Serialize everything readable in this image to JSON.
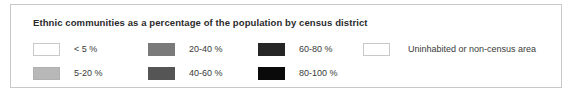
{
  "legend": {
    "title": "Ethnic communities as a percentage of the population by census district",
    "border_color": "#c9c9c9",
    "background_color": "#ffffff",
    "title_color": "#2b2b2b",
    "label_color": "#3a3a3a",
    "items": [
      {
        "label": "< 5 %",
        "color": "#ffffff",
        "border_color": "#c9c9c9",
        "swatch_name": "swatch-lt-5-percent",
        "column": 0,
        "row": 0
      },
      {
        "label": "5-20 %",
        "color": "#b8b8b8",
        "border_color": "#b0b0b0",
        "swatch_name": "swatch-5-20-percent",
        "column": 0,
        "row": 1
      },
      {
        "label": "20-40 %",
        "color": "#7a7a7a",
        "border_color": "#7a7a7a",
        "swatch_name": "swatch-20-40-percent",
        "column": 1,
        "row": 0
      },
      {
        "label": "40-60 %",
        "color": "#555555",
        "border_color": "#555555",
        "swatch_name": "swatch-40-60-percent",
        "column": 1,
        "row": 1
      },
      {
        "label": "60-80 %",
        "color": "#262626",
        "border_color": "#262626",
        "swatch_name": "swatch-60-80-percent",
        "column": 2,
        "row": 0
      },
      {
        "label": "80-100 %",
        "color": "#0a0a0a",
        "border_color": "#0a0a0a",
        "swatch_name": "swatch-80-100-percent",
        "column": 2,
        "row": 1
      },
      {
        "label": "Uninhabited or non-census area",
        "color": "#ffffff",
        "border_color": "#c9c9c9",
        "swatch_name": "swatch-uninhabited",
        "column": 3,
        "row": 0
      }
    ]
  },
  "chart_data": {
    "type": "table",
    "title": "Ethnic communities as a percentage of the population by census district",
    "xlabel": "",
    "ylabel": "",
    "legend_position": "standalone",
    "grid": false,
    "categories": [
      "< 5 %",
      "5-20 %",
      "20-40 %",
      "40-60 %",
      "60-80 %",
      "80-100 %",
      "Uninhabited or non-census area"
    ],
    "values": [
      {
        "bin": "< 5 %",
        "range_low": 0,
        "range_high": 5,
        "fill": "#ffffff"
      },
      {
        "bin": "5-20 %",
        "range_low": 5,
        "range_high": 20,
        "fill": "#b8b8b8"
      },
      {
        "bin": "20-40 %",
        "range_low": 20,
        "range_high": 40,
        "fill": "#7a7a7a"
      },
      {
        "bin": "40-60 %",
        "range_low": 40,
        "range_high": 60,
        "fill": "#555555"
      },
      {
        "bin": "60-80 %",
        "range_low": 60,
        "range_high": 80,
        "fill": "#262626"
      },
      {
        "bin": "80-100 %",
        "range_low": 80,
        "range_high": 100,
        "fill": "#0a0a0a"
      },
      {
        "bin": "Uninhabited or non-census area",
        "range_low": null,
        "range_high": null,
        "fill": "#ffffff"
      }
    ],
    "annotations": [
      "Choropleth map legend: sequential white-to-black grayscale ramp in six percentage bins plus one no-data category."
    ]
  }
}
